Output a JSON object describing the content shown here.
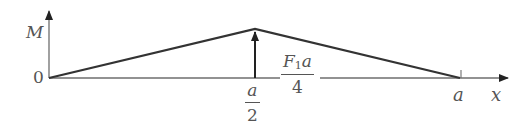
{
  "diagram": {
    "type": "bending-moment-diagram",
    "axes": {
      "y_label": "M",
      "x_label": "x",
      "origin_label": "0"
    },
    "x_ticks": {
      "mid": {
        "numerator": "a",
        "denominator": "2"
      },
      "end": "a"
    },
    "peak_label": {
      "numerator_main": "F",
      "numerator_sub": "1",
      "numerator_tail": "a",
      "denominator": "4"
    },
    "shape": {
      "points": [
        {
          "x": "0",
          "M": "0"
        },
        {
          "x": "a/2",
          "M": "F1a/4"
        },
        {
          "x": "a",
          "M": "0"
        }
      ]
    },
    "colors": {
      "axis": "#6e6e6e",
      "curve": "#333333",
      "text": "#555555"
    }
  }
}
